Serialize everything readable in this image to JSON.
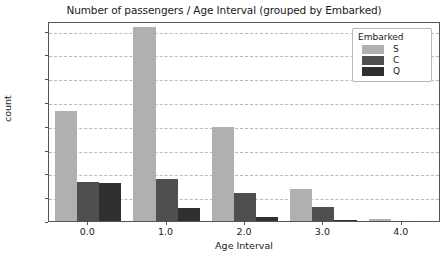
{
  "chart_data": {
    "type": "bar",
    "title": "Number of passengers / Age Interval (grouped by Embarked)",
    "xlabel": "Age Interval",
    "ylabel": "count",
    "categories": [
      "0.0",
      "1.0",
      "2.0",
      "3.0",
      "4.0"
    ],
    "series": [
      {
        "name": "S",
        "color": "#b0b0b0",
        "values": [
          231,
          407,
          197,
          67,
          5
        ]
      },
      {
        "name": "C",
        "color": "#4f4f4f",
        "values": [
          82,
          89,
          59,
          30,
          1
        ]
      },
      {
        "name": "Q",
        "color": "#2f2f2f",
        "values": [
          80,
          27,
          8,
          2,
          0
        ]
      }
    ],
    "ylim": [
      0,
      420
    ],
    "yticks": [
      0,
      50,
      100,
      150,
      200,
      250,
      300,
      350,
      400
    ],
    "ytick_labels": [
      "0",
      "50",
      "100",
      "150",
      "200",
      "250",
      "300",
      "350",
      "400"
    ],
    "xtick_labels": [
      "0.0",
      "1.0",
      "2.0",
      "3.0",
      "4.0"
    ],
    "grid": true,
    "grid_axis": "y",
    "grid_style": "dashed",
    "legend": {
      "title": "Embarked",
      "position": "upper right",
      "entries": [
        {
          "label": "S",
          "color": "#b0b0b0"
        },
        {
          "label": "C",
          "color": "#4f4f4f"
        },
        {
          "label": "Q",
          "color": "#2f2f2f"
        }
      ]
    }
  }
}
